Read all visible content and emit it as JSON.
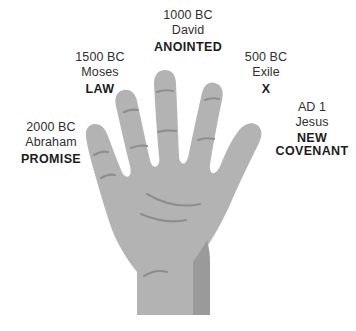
{
  "image": {
    "title": "Hand Outline Bible Timeline Mnemonic",
    "background_color": "#ffffff",
    "hand_fill": "#b3b3b3",
    "hand_shadow": "#9a9a9a",
    "crease_color": "#8e8e8e",
    "text_color": "#2f2f2f",
    "bold_text_color": "#1c1c1c"
  },
  "labels": [
    {
      "id": "promise",
      "finger": "thumb-pinky-left",
      "date": "2000 BC",
      "person": "Abraham",
      "theme": "PROMISE",
      "theme_lines": [
        "PROMISE"
      ]
    },
    {
      "id": "law",
      "finger": "ring-left",
      "date": "1500 BC",
      "person": "Moses",
      "theme": "LAW",
      "theme_lines": [
        "LAW"
      ]
    },
    {
      "id": "anointed",
      "finger": "middle",
      "date": "1000 BC",
      "person": "David",
      "theme": "ANOINTED",
      "theme_lines": [
        "ANOINTED"
      ]
    },
    {
      "id": "exile",
      "finger": "index",
      "date": "500 BC",
      "person": "Exile",
      "theme": "X",
      "theme_lines": [
        "X"
      ]
    },
    {
      "id": "new-covenant",
      "finger": "thumb",
      "date": "AD 1",
      "person": "Jesus",
      "theme": "NEW COVENANT",
      "theme_lines": [
        "NEW",
        "COVENANT"
      ]
    }
  ]
}
